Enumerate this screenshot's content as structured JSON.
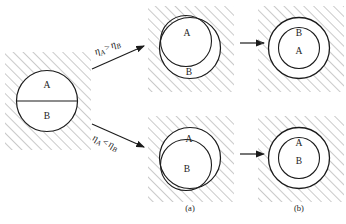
{
  "figure": {
    "background_color": "#ffffff",
    "line_color": "#1b1b1b",
    "hatch_color": "#8a8a8a",
    "columns": [
      {
        "key": "initial",
        "caption": ""
      },
      {
        "key": "intermediate",
        "caption": "(a)"
      },
      {
        "key": "final",
        "caption": "(b)"
      }
    ],
    "captions": {
      "a": "(a)",
      "b": "(b)"
    },
    "initial_state": {
      "name": "initial-circle",
      "top_label": "A",
      "bottom_label": "B",
      "divider": "horizontal"
    },
    "branches": [
      {
        "key": "top",
        "condition": {
          "symbol": "η",
          "left_subscript": "A",
          "operator": ">",
          "right_subscript": "B",
          "text": "ηA > ηB"
        },
        "intermediate": {
          "inner_label": "A",
          "outer_label": "B",
          "inner_offset": "up-left"
        },
        "final": {
          "annulus_label": "B",
          "core_label": "A"
        },
        "arrow_label": ""
      },
      {
        "key": "bottom",
        "condition": {
          "symbol": "η",
          "left_subscript": "A",
          "operator": "<",
          "right_subscript": "B",
          "text": "ηA < ηB"
        },
        "intermediate": {
          "inner_label": "B",
          "outer_label": "A",
          "inner_offset": "down-left"
        },
        "final": {
          "annulus_label": "A",
          "core_label": "B"
        },
        "arrow_label": ""
      }
    ]
  }
}
